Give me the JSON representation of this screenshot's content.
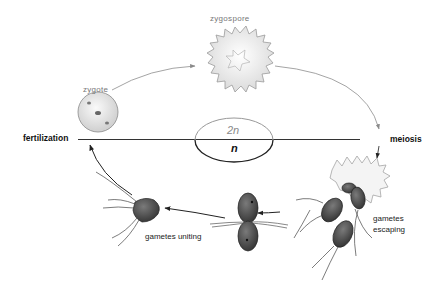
{
  "diagram": {
    "type": "life-cycle",
    "colors": {
      "background": "#ffffff",
      "label_dark": "#111111",
      "label_grey": "#777777",
      "cell_fill": "#555555",
      "spore_fill": "#f2f2f2",
      "arrow_light": "#9a9a9a",
      "arrow_dark": "#222222"
    },
    "divider": {
      "left_label": "fertilization",
      "right_label": "meiosis"
    },
    "ploidy": {
      "upper": "2n",
      "lower": "n"
    },
    "stages": [
      {
        "id": "zygote",
        "label": "zygote",
        "phase": "2n"
      },
      {
        "id": "zygospore",
        "label": "zygospore",
        "phase": "2n"
      },
      {
        "id": "gametes-escaping",
        "label_line1": "gametes",
        "label_line2": "escaping",
        "phase": "n"
      },
      {
        "id": "gametes-uniting",
        "label": "gametes uniting",
        "phase": "n"
      }
    ]
  }
}
